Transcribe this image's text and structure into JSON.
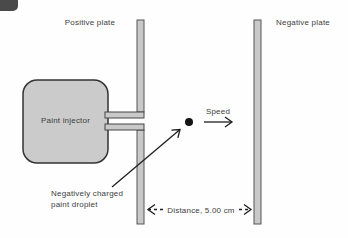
{
  "figure": {
    "labels": {
      "positive_plate": "Positive plate",
      "negative_plate": "Negative plate",
      "paint_injector": "Paint injector",
      "speed": "Speed",
      "droplet_line1": "Negatively charged",
      "droplet_line2": "paint droplet",
      "distance": "Distance, 5.00 cm"
    },
    "colors": {
      "background": "#fefefe",
      "plate_fill": "#c9c9c9",
      "plate_stroke": "#555555",
      "injector_fill": "#cbcbcb",
      "injector_stroke": "#333333",
      "tube_fill": "#c9c9c9",
      "tube_stroke": "#444444",
      "droplet_fill": "#151515",
      "line_stroke": "#1e1e1e",
      "text": "#3d3d3d",
      "corner_artifact": "#4a4a4a"
    }
  }
}
